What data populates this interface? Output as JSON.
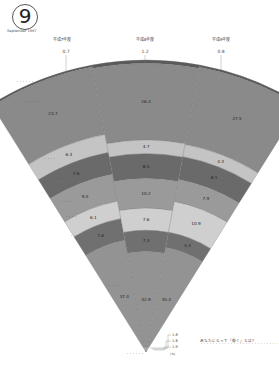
{
  "header": {
    "issue_number": "9",
    "issue_date": "September 1997"
  },
  "chart_data": {
    "type": "stacked-fan",
    "title": "",
    "categories": [
      "平成7年度",
      "平成8年度",
      "平成9年度"
    ],
    "series": [
      {
        "name": "row1",
        "values": [
          0.7,
          1.2,
          0.8
        ]
      },
      {
        "name": "row2",
        "values": [
          23.7,
          26.3,
          27.5
        ]
      },
      {
        "name": "row3",
        "values": [
          6.3,
          4.7,
          4.3
        ]
      },
      {
        "name": "row4",
        "values": [
          7.6,
          8.5,
          8.1
        ]
      },
      {
        "name": "row5",
        "values": [
          9.5,
          10.2,
          7.9
        ]
      },
      {
        "name": "row6",
        "values": [
          6.1,
          7.6,
          10.9
        ]
      },
      {
        "name": "row7",
        "values": [
          7.6,
          7.3,
          5.4
        ]
      },
      {
        "name": "row8",
        "values": [
          37.4,
          32.9,
          35.3
        ]
      },
      {
        "name": "row9",
        "values": [
          1.8,
          1.6,
          1.9
        ]
      }
    ],
    "units": "%",
    "colors": [
      "#5a5a5a",
      "#8a8a8a",
      "#c4c4c4",
      "#6a6a6a",
      "#9a9a9a",
      "#cfcfcf",
      "#707070",
      "#939393",
      "#b0b0b0"
    ]
  },
  "labels": {
    "top_values": [
      "0.7",
      "1.2",
      "0.8"
    ],
    "bottom_values": [
      "1.8",
      "1.6",
      "1.9"
    ],
    "bottom_value_caption": "(%)",
    "row_labels": [
      "・・・・・・",
      "・・・・・",
      "・・・・",
      "・・・・",
      "・・・・",
      "・・・・",
      "・・・・",
      "・・・・",
      "・・・・・・"
    ]
  },
  "note": {
    "title": "あなたにとって「働く」とは？",
    "body": "・・・・・・・・・・・・・・・・・・・・・・・・・・・・・・・・・・・・・・・・・・・・・・・・・・・・・・・・・・・・・・・・・・・・・・・・・・・・・・・・・・・・・・・・・・・・・・・・・・・・・・・・・・・・・・・・・・・・・・・・・・"
  }
}
